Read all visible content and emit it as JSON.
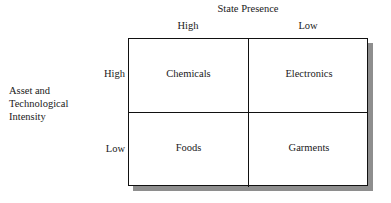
{
  "diagram": {
    "column_axis": {
      "title": "State Presence",
      "headers": [
        "High",
        "Low"
      ]
    },
    "row_axis": {
      "title_lines": [
        "Asset and",
        "Technological",
        "Intensity"
      ],
      "headers": [
        "High",
        "Low"
      ]
    },
    "cells": [
      [
        "Chemicals",
        "Electronics"
      ],
      [
        "Foods",
        "Garments"
      ]
    ],
    "colors": {
      "background": "#ffffff",
      "border": "#111111",
      "text": "#1a1a1a",
      "shadow": "#8e8e8e"
    }
  }
}
